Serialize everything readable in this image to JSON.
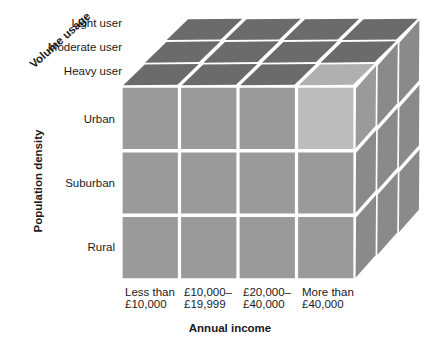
{
  "chart_data": {
    "type": "diagram",
    "title": "",
    "subtitle": "",
    "diagram_kind": "3d-segmentation-cube",
    "axes": {
      "x": {
        "label": "Annual income",
        "categories": [
          "Less than £10,000",
          "£10,000–£19,999",
          "£20,000–£40,000",
          "More than £40,000"
        ],
        "lines": [
          [
            "Less than",
            "£10,000"
          ],
          [
            "£10,000–",
            "£19,999"
          ],
          [
            "£20,000–",
            "£40,000"
          ],
          [
            "More than",
            "£40,000"
          ]
        ]
      },
      "y": {
        "label": "Population density",
        "categories": [
          "Urban",
          "Suburban",
          "Rural"
        ]
      },
      "z": {
        "label": "Volume usage",
        "categories": [
          "Light user",
          "Moderate user",
          "Heavy user"
        ]
      }
    },
    "highlighted_cell": {
      "x": "More than £40,000",
      "y": "Urban",
      "z": "Heavy user"
    },
    "colors": {
      "front_face": "#9a9a9a",
      "front_face_highlight": "#bcbcbc",
      "top_face": "#6b6b6b",
      "top_face_highlight": "#b0b0b0",
      "side_face": "#8a8a8a",
      "side_face_highlight": "#9a9a9a",
      "gap": "#ffffff",
      "text": "#1a1a1a"
    },
    "counts": {
      "columns": 4,
      "rows": 3,
      "depth": 3
    }
  },
  "labels": {
    "x_axis_title": "Annual income",
    "y_axis_title": "Population density",
    "z_axis_title": "Volume usage",
    "z_items": [
      "Light user",
      "Moderate user",
      "Heavy user"
    ],
    "y_items": [
      "Urban",
      "Suburban",
      "Rural"
    ],
    "x_items": [
      {
        "line1": "Less than",
        "line2": "£10,000"
      },
      {
        "line1": "£10,000–",
        "line2": "£19,999"
      },
      {
        "line1": "£20,000–",
        "line2": "£40,000"
      },
      {
        "line1": "More than",
        "line2": "£40,000"
      }
    ]
  }
}
